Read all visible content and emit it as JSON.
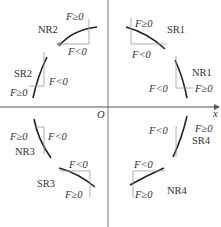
{
  "axes": {
    "x_label": "x",
    "origin_label": "O"
  },
  "quadrants": [
    {
      "id": "q1",
      "regions": [
        {
          "name": "SR1",
          "f_pos": "F≥0",
          "f_neg": "F<0"
        },
        {
          "name": "NR1",
          "f_pos": "F≥0",
          "f_neg": "F<0"
        }
      ]
    },
    {
      "id": "q2",
      "regions": [
        {
          "name": "NR2",
          "f_pos": "F≥0",
          "f_neg": "F<0"
        },
        {
          "name": "SR2",
          "f_pos": "F≥0",
          "f_neg": "F<0"
        }
      ]
    },
    {
      "id": "q3",
      "regions": [
        {
          "name": "NR3",
          "f_pos": "F≥0",
          "f_neg": "F<0"
        },
        {
          "name": "SR3",
          "f_pos": "F≥0",
          "f_neg": "F<0"
        }
      ]
    },
    {
      "id": "q4",
      "regions": [
        {
          "name": "SR4",
          "f_pos": "F≥0",
          "f_neg": "F<0"
        },
        {
          "name": "NR4",
          "f_pos": "F≥0",
          "f_neg": "F<0"
        }
      ]
    }
  ],
  "colors": {
    "axis": "#555555",
    "arc": "#222222",
    "step": "#888888",
    "text": "#333333"
  }
}
